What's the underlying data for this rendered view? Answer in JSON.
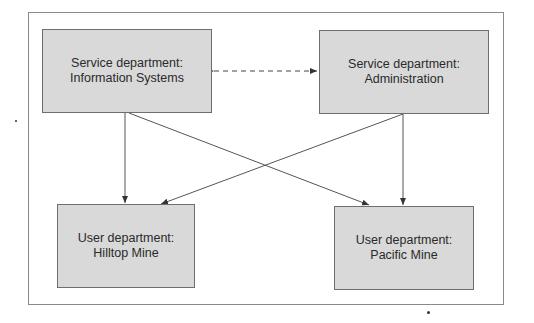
{
  "diagram": {
    "nodes": [
      {
        "id": "is",
        "type": "Service department",
        "line1": "Service department:",
        "line2": "Information Systems"
      },
      {
        "id": "admin",
        "type": "Service department",
        "line1": "Service department:",
        "line2": "Administration"
      },
      {
        "id": "hilltop",
        "type": "User department",
        "line1": "User department:",
        "line2": "Hilltop Mine"
      },
      {
        "id": "pacific",
        "type": "User department",
        "line1": "User department:",
        "line2": "Pacific Mine"
      }
    ],
    "edges": [
      {
        "from": "is",
        "to": "admin",
        "style": "dashed",
        "direction": "both"
      },
      {
        "from": "is",
        "to": "hilltop",
        "style": "solid",
        "direction": "forward"
      },
      {
        "from": "is",
        "to": "pacific",
        "style": "solid",
        "direction": "forward"
      },
      {
        "from": "admin",
        "to": "hilltop",
        "style": "solid",
        "direction": "forward"
      },
      {
        "from": "admin",
        "to": "pacific",
        "style": "solid",
        "direction": "forward"
      }
    ],
    "colors": {
      "box_fill": "#d9d9d9",
      "box_border": "#6e6e6e",
      "line": "#555555",
      "frame": "#8a8a8a"
    }
  }
}
